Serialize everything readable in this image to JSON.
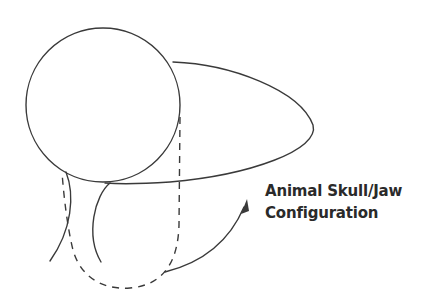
{
  "diagram": {
    "label_line1": "Animal Skull/Jaw",
    "label_line2": "Configuration",
    "stroke_color": "#3a3a3a",
    "text_color": "#2a2a2a",
    "background": "#ffffff"
  }
}
